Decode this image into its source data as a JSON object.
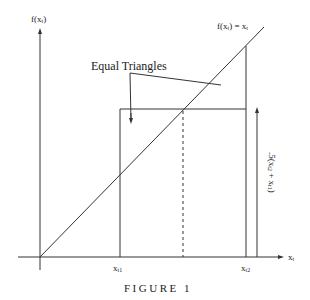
{
  "figure": {
    "caption": "FIGURE 1",
    "y_axis_label": {
      "text": "f(x",
      "sub": "t",
      "close": ")"
    },
    "x_axis_label": {
      "text": "x",
      "sub": "t"
    },
    "line_label": {
      "text": "f(x",
      "sub": "t",
      "mid": ") = x",
      "sub2": "t"
    },
    "callout_label": "Equal Triangles",
    "tick_labels": [
      {
        "text": "x",
        "sub": "t1"
      },
      {
        "text": "x",
        "sub": "t2"
      }
    ],
    "height_label": {
      "text": ".5(x",
      "sub": "t2",
      "mid": " + x",
      "sub2": "t1",
      "close": ")"
    }
  },
  "colors": {
    "line": "#333333",
    "background": "#ffffff"
  }
}
